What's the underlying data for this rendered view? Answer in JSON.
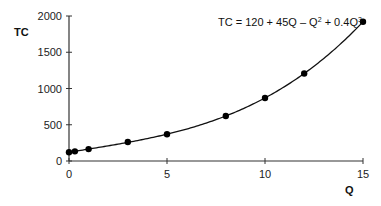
{
  "chart_data": {
    "type": "line",
    "title": "",
    "equation": "TC = 120 + 45Q – Q² + 0.4Q³",
    "equation_parts": [
      "TC = 120 + 45Q – Q",
      "2",
      " + 0.4Q",
      "3"
    ],
    "xlabel": "Q",
    "ylabel": "TC",
    "xlim": [
      0,
      15
    ],
    "ylim": [
      0,
      2000
    ],
    "x_ticks": [
      0,
      5,
      10,
      15
    ],
    "y_ticks": [
      0,
      500,
      1000,
      1500,
      2000
    ],
    "grid": false,
    "legend": null,
    "series": [
      {
        "name": "TC points",
        "style": "markers",
        "x": [
          0,
          0.3,
          1,
          3,
          5,
          8,
          10,
          12,
          15
        ],
        "y": [
          120,
          133.4,
          164.4,
          262.8,
          370,
          620.8,
          870,
          1207.2,
          1920
        ]
      },
      {
        "name": "TC curve",
        "style": "smooth-line",
        "function": "120 + 45Q - Q^2 + 0.4Q^3"
      }
    ]
  },
  "colors": {
    "line": "#111111",
    "marker": "#000000",
    "axis": "#333333"
  }
}
